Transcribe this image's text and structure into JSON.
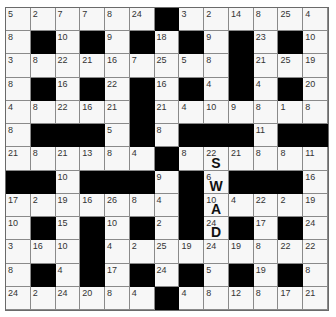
{
  "puzzle": {
    "type": "codeword",
    "rows": 13,
    "cols": 13,
    "colors": {
      "black": "#000000",
      "white": "#f7f7f7",
      "line": "#8a8a8a",
      "number": "#333333",
      "letter": "#111111"
    },
    "grid": [
      [
        5,
        2,
        7,
        7,
        8,
        24,
        null,
        3,
        2,
        14,
        8,
        25,
        4
      ],
      [
        8,
        null,
        10,
        null,
        9,
        null,
        18,
        null,
        9,
        null,
        23,
        null,
        10
      ],
      [
        3,
        8,
        22,
        21,
        16,
        7,
        25,
        5,
        8,
        null,
        21,
        25,
        19
      ],
      [
        8,
        null,
        16,
        null,
        22,
        null,
        16,
        null,
        4,
        null,
        4,
        null,
        20
      ],
      [
        4,
        8,
        22,
        16,
        21,
        null,
        21,
        4,
        10,
        9,
        8,
        1,
        8
      ],
      [
        8,
        null,
        null,
        null,
        5,
        null,
        8,
        null,
        null,
        null,
        11,
        null,
        null
      ],
      [
        21,
        8,
        21,
        13,
        8,
        4,
        null,
        8,
        22,
        21,
        8,
        8,
        11
      ],
      [
        null,
        null,
        10,
        null,
        null,
        null,
        9,
        null,
        6,
        null,
        null,
        null,
        16
      ],
      [
        17,
        2,
        19,
        16,
        26,
        8,
        4,
        null,
        10,
        4,
        22,
        2,
        19
      ],
      [
        10,
        null,
        15,
        null,
        10,
        null,
        2,
        null,
        24,
        null,
        17,
        null,
        24
      ],
      [
        3,
        16,
        10,
        null,
        4,
        2,
        25,
        19,
        24,
        19,
        8,
        22,
        22
      ],
      [
        8,
        null,
        4,
        null,
        17,
        null,
        24,
        null,
        5,
        null,
        19,
        null,
        8
      ],
      [
        24,
        2,
        24,
        20,
        8,
        4,
        null,
        4,
        8,
        12,
        8,
        17,
        21
      ]
    ],
    "revealed_letters": [
      {
        "row": 6,
        "col": 8,
        "number": 22,
        "letter": "S"
      },
      {
        "row": 7,
        "col": 8,
        "number": 6,
        "letter": "W"
      },
      {
        "row": 8,
        "col": 8,
        "number": 10,
        "letter": "A"
      },
      {
        "row": 9,
        "col": 8,
        "number": 24,
        "letter": "D"
      }
    ]
  }
}
